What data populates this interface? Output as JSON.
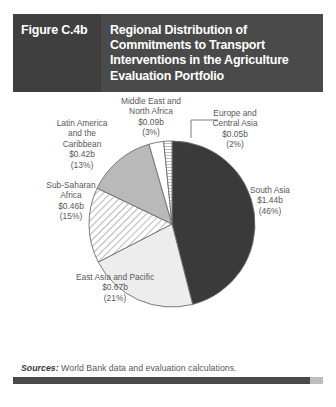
{
  "figure": {
    "number": "Figure C.4b",
    "title": "Regional Distribution of Commitments to Transport Interventions in the Agriculture Evaluation Portfolio",
    "header_bg": "#4a4a4a",
    "number_panel_bg": "#3f3f3f",
    "header_text_color": "#ffffff"
  },
  "footer": {
    "sources_label": "Sources:",
    "sources_text": "World Bank data and evaluation calculations."
  },
  "labels": {
    "middle_east": "Middle East and\nNorth Africa\n$0.09b\n(3%)",
    "europe": "Europe and\nCentral Asia\n$0.05b\n(2%)",
    "latin_america": "Latin America\nand the\nCaribbean\n$0.42b\n(13%)",
    "sub_saharan": "Sub-Saharan\nAfrica\n$0.46b\n(15%)",
    "south_asia": "South Asia\n$1.44b\n(46%)",
    "east_asia": "East Asia and Pacific\n$0.67b\n(21%)"
  },
  "chart_data": {
    "type": "pie",
    "title": "Regional Distribution of Commitments to Transport Interventions in the Agriculture Evaluation Portfolio",
    "unit": "US$ billions",
    "value_prefix": "$",
    "value_suffix": "b",
    "legend": "none",
    "labels_position": "outside",
    "start_angle": 0,
    "direction": "clockwise",
    "categories": [
      "South Asia",
      "East Asia and Pacific",
      "Sub-Saharan Africa",
      "Latin America and the Caribbean",
      "Middle East and North Africa",
      "Europe and Central Asia"
    ],
    "values": [
      1.44,
      0.67,
      0.46,
      0.42,
      0.09,
      0.05
    ],
    "percentages": [
      46,
      21,
      15,
      13,
      3,
      2
    ],
    "value_text": [
      "$1.44b",
      "$0.67b",
      "$0.46b",
      "$0.42b",
      "$0.09b",
      "$0.05b"
    ],
    "percent_text": [
      "(46%)",
      "(21%)",
      "(15%)",
      "(13%)",
      "(3%)",
      "(2%)"
    ],
    "total": 3.13,
    "slice_fills": [
      "#3a3a3a",
      "#ededed",
      "diagonal-hatch",
      "#b9b9b9",
      "#ffffff",
      "horizontal-hatch"
    ],
    "stroke": "#6d6d6d"
  }
}
